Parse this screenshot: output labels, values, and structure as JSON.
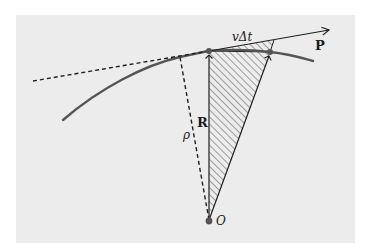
{
  "diagram": {
    "type": "physics-geometry",
    "colors": {
      "panel_bg": "#ececec",
      "page_bg": "#ffffff",
      "curve": "#555555",
      "lines": "#1f1f1f",
      "points": "#555555",
      "hatch": "#3a3a3a"
    },
    "labels": {
      "velocity_displacement": "vΔt",
      "momentum": "P",
      "position_vector": "R",
      "perpendicular_distance": "ρ",
      "origin": "O"
    },
    "elements": [
      {
        "name": "trajectory-curve",
        "description": "curved path of the particle"
      },
      {
        "name": "tangent-line",
        "description": "dashed tangent line extended backward, solid arrow forward along P"
      },
      {
        "name": "position-vector-R",
        "description": "arrow from O to particle position"
      },
      {
        "name": "perpendicular-rho",
        "description": "dashed perpendicular from O to the tangent line"
      },
      {
        "name": "swept-area",
        "description": "hatched triangle swept by R in time Δt"
      },
      {
        "name": "origin-point",
        "description": "point O"
      }
    ]
  }
}
